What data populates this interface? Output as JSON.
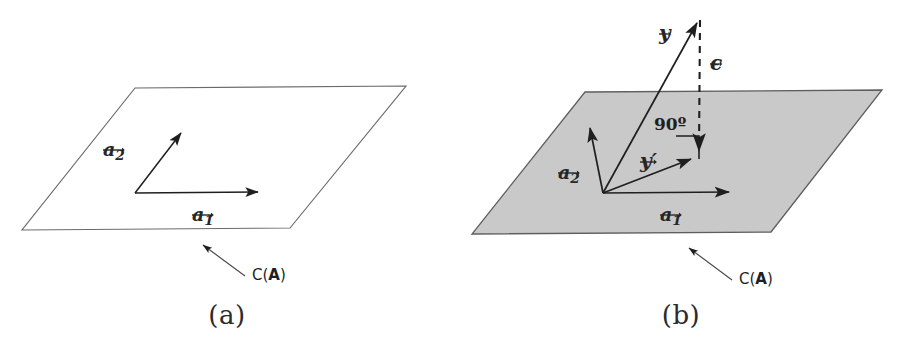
{
  "figure": {
    "title_text": "Column space of A and orthogonal projection of y",
    "background_color": "#ffffff",
    "line_color": "#595959",
    "vector_color": "#1f1f1f",
    "plane_fill_a": "#ffffff",
    "plane_fill_b": "#c8c8c8"
  },
  "panels": [
    {
      "id": "a",
      "caption": "(a)",
      "plane": {
        "label": "C(A)",
        "label_prefix": "C(",
        "label_bold": "A",
        "label_suffix": ")",
        "filled": false,
        "corners": [
          [
            135,
            88
          ],
          [
            406,
            86
          ],
          [
            290,
            228
          ],
          [
            22,
            230
          ]
        ]
      },
      "vectors": [
        {
          "name": "a1",
          "label_base": "a",
          "label_sub": "1",
          "from": [
            135,
            193
          ],
          "to": [
            265,
            192
          ]
        },
        {
          "name": "a2",
          "label_base": "a",
          "label_sub": "2",
          "from": [
            135,
            193
          ],
          "to": [
            185,
            128
          ]
        }
      ],
      "labels": {
        "a1": "a1",
        "a2": "a2"
      }
    },
    {
      "id": "b",
      "caption": "(b)",
      "plane": {
        "label": "C(A)",
        "label_prefix": "C(",
        "label_bold": "A",
        "label_suffix": ")",
        "filled": true,
        "corners": [
          [
            131,
            92
          ],
          [
            428,
            90
          ],
          [
            317,
            232
          ],
          [
            18,
            234
          ]
        ]
      },
      "vectors": [
        {
          "name": "a1",
          "label_base": "a",
          "label_sub": "1",
          "from": [
            149,
            193
          ],
          "to": [
            282,
            192
          ]
        },
        {
          "name": "a2",
          "label_base": "a",
          "label_sub": "2",
          "from": [
            149,
            193
          ],
          "to": [
            135,
            122
          ]
        },
        {
          "name": "y",
          "label_base": "y",
          "label_sub": "",
          "from": [
            149,
            193
          ],
          "to": [
            246,
            16
          ]
        },
        {
          "name": "yhat",
          "label_base": "y",
          "label_sub": "",
          "prime": "′",
          "from": [
            149,
            193
          ],
          "to": [
            244,
            157
          ]
        }
      ],
      "residual": {
        "name": "epsilon",
        "label_base": "ϵ",
        "style": "dashed",
        "from": [
          246,
          18
        ],
        "to": [
          245,
          157
        ]
      },
      "right_angle": {
        "label": "90º",
        "corner": [
          244,
          157
        ],
        "size": 24
      },
      "labels": {
        "a1": "a1",
        "a2": "a2",
        "y": "y",
        "yhat": "y′",
        "epsilon": "ϵ",
        "angle": "90º"
      }
    }
  ]
}
